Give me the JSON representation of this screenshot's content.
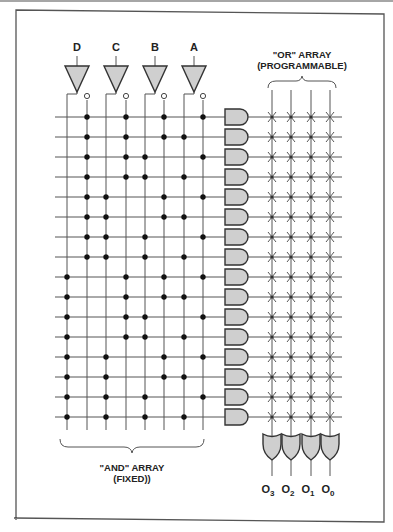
{
  "diagram": {
    "title_or": "\"OR\" ARRAY",
    "subtitle_or": "(PROGRAMMABLE)",
    "title_and": "\"AND\" ARRAY",
    "subtitle_and": "(FIXED))",
    "inputs": [
      "D",
      "C",
      "B",
      "A"
    ],
    "outputs": [
      {
        "base": "O",
        "sub": "3"
      },
      {
        "base": "O",
        "sub": "2"
      },
      {
        "base": "O",
        "sub": "1"
      },
      {
        "base": "O",
        "sub": "0"
      }
    ],
    "and_gate_count": 16,
    "or_gate_count": 4,
    "and_connections": [
      [
        2,
        4,
        6,
        8
      ],
      [
        2,
        4,
        6,
        7
      ],
      [
        2,
        4,
        5,
        8
      ],
      [
        2,
        4,
        5,
        7
      ],
      [
        2,
        3,
        6,
        8
      ],
      [
        2,
        3,
        6,
        7
      ],
      [
        2,
        3,
        5,
        8
      ],
      [
        2,
        3,
        5,
        7
      ],
      [
        1,
        4,
        6,
        8
      ],
      [
        1,
        4,
        6,
        7
      ],
      [
        1,
        4,
        5,
        8
      ],
      [
        1,
        4,
        5,
        7
      ],
      [
        1,
        3,
        6,
        8
      ],
      [
        1,
        3,
        6,
        7
      ],
      [
        1,
        3,
        5,
        8
      ],
      [
        1,
        3,
        5,
        7
      ]
    ],
    "colors": {
      "gate_fill": "#cfcfcf",
      "line": "#555555",
      "dot": "#111111"
    }
  }
}
